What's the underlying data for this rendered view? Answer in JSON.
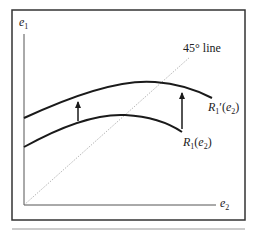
{
  "diagram": {
    "y_axis_label": "e",
    "y_axis_sub": "1",
    "x_axis_label": "e",
    "x_axis_sub": "2",
    "line_45_label": "45° line",
    "curve_new": {
      "name": "R",
      "sub": "1",
      "prime": "′",
      "arg_open": "(",
      "arg": "e",
      "arg_sub": "2",
      "arg_close": ")"
    },
    "curve_old": {
      "name": "R",
      "sub": "1",
      "arg_open": "(",
      "arg": "e",
      "arg_sub": "2",
      "arg_close": ")"
    },
    "arrows": [
      "upward shift arrow left",
      "upward shift arrow right"
    ],
    "colors": {
      "frame": "#333333",
      "curve": "#1a1a1a",
      "axis": "#555555",
      "dotted": "#888888"
    }
  }
}
